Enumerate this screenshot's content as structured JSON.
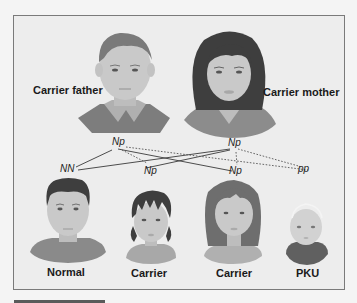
{
  "parents": {
    "father": {
      "label": "Carrier father",
      "genotype": "Np"
    },
    "mother": {
      "label": "Carrier mother",
      "genotype": "Np"
    }
  },
  "children": [
    {
      "label": "Normal",
      "genotype": "NN"
    },
    {
      "label": "Carrier",
      "genotype": "Np"
    },
    {
      "label": "Carrier",
      "genotype": "Np"
    },
    {
      "label": "PKU",
      "genotype": "pp"
    }
  ],
  "colors": {
    "background": "#ededed",
    "frame_border": "#7a7a7a",
    "skin": "#c9c9c9",
    "hair_dark": "#4a4a4a",
    "hair_medium": "#6e6e6e",
    "shirt": "#8a8a8a",
    "text": "#1a1a1a"
  }
}
